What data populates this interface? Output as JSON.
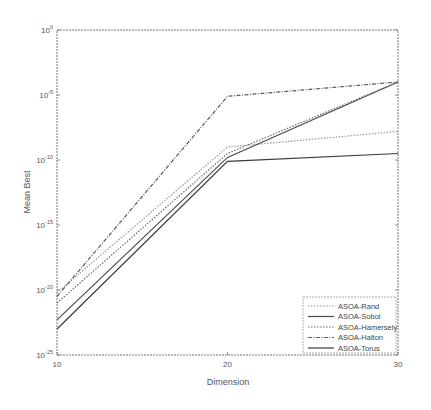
{
  "chart_data": {
    "type": "line",
    "title": "",
    "xlabel": "Dimension",
    "ylabel": "Mean Best",
    "x": [
      10,
      20,
      30
    ],
    "xticks": [
      "10",
      "20",
      "30"
    ],
    "xlim": [
      10,
      30
    ],
    "yscale": "log",
    "ylim_exp": [
      -25,
      0
    ],
    "yticks": [
      {
        "exp": 0,
        "label": "10",
        "sup": "0"
      },
      {
        "exp": -5,
        "label": "10",
        "sup": "-5"
      },
      {
        "exp": -10,
        "label": "10",
        "sup": "-10"
      },
      {
        "exp": -15,
        "label": "10",
        "sup": "-15"
      },
      {
        "exp": -20,
        "label": "10",
        "sup": "-20"
      },
      {
        "exp": -25,
        "label": "10",
        "sup": "-25"
      }
    ],
    "grid": false,
    "legend_position": "lower right",
    "series": [
      {
        "name": "ASOA-Rand",
        "log10_values": [
          -20.2,
          -9.0,
          -7.8
        ],
        "values": [
          6.3e-21,
          1e-09,
          1.6e-08
        ],
        "style": "dotted",
        "color": "#9a9a9a"
      },
      {
        "name": "ASOA-Sobol",
        "log10_values": [
          -22.3,
          -9.8,
          -4.0
        ],
        "values": [
          5e-23,
          1.6e-10,
          0.0001
        ],
        "style": "solid",
        "color": "#4a4a4a"
      },
      {
        "name": "ASOA-Hamersely",
        "log10_values": [
          -21.0,
          -9.5,
          -4.0
        ],
        "values": [
          1e-21,
          3.2e-10,
          0.0001
        ],
        "style": "dotted",
        "color": "#6a6a6a"
      },
      {
        "name": "ASOA-Halton",
        "log10_values": [
          -20.5,
          -5.1,
          -4.0
        ],
        "values": [
          3.2e-21,
          7.9e-06,
          0.0001
        ],
        "style": "dashdot",
        "color": "#5a5a5a"
      },
      {
        "name": "ASOA-Torus",
        "log10_values": [
          -23.0,
          -10.1,
          -9.5
        ],
        "values": [
          1e-23,
          7.9e-11,
          3.2e-10
        ],
        "style": "solid",
        "color": "#3a3a3a"
      }
    ]
  }
}
